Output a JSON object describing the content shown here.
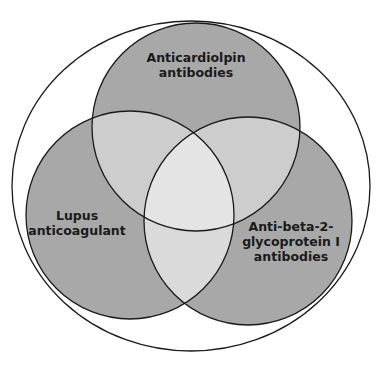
{
  "diagram": {
    "type": "venn",
    "colors": {
      "background": "#ffffff",
      "outline": "#1a1a1a",
      "single": "#a8a8a8",
      "double": "#cdcdcd",
      "triple": "#e4e4e4"
    },
    "sets": [
      {
        "id": "acl",
        "label_lines": [
          "Anticardiolpin",
          "antibodies"
        ]
      },
      {
        "id": "la",
        "label_lines": [
          "Lupus",
          "anticoagulant"
        ]
      },
      {
        "id": "b2gpi",
        "label_lines": [
          "Anti-beta-2-",
          "glycoprotein I",
          "antibodies"
        ]
      }
    ],
    "enclosure": "outer ellipse enclosing all three sets"
  }
}
